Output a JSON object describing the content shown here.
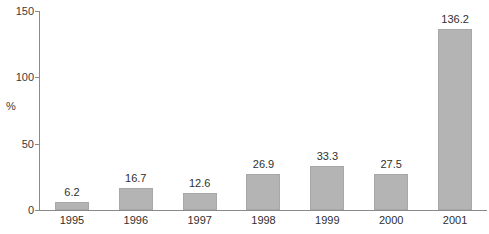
{
  "chart_data": {
    "type": "bar",
    "title": "",
    "subtitle": "",
    "xlabel": "",
    "ylabel": "%",
    "categories": [
      "1995",
      "1996",
      "1997",
      "1998",
      "1999",
      "2000",
      "2001"
    ],
    "values": [
      6.2,
      16.7,
      12.6,
      26.9,
      33.3,
      27.5,
      136.2
    ],
    "value_labels": [
      "6.2",
      "16.7",
      "12.6",
      "26.9",
      "33.3",
      "27.5",
      "136.2"
    ],
    "ylim": [
      0,
      150
    ],
    "y_ticks": [
      0,
      50,
      100,
      150
    ],
    "y_tick_labels": [
      "0",
      "50",
      "100",
      "150"
    ],
    "grid": false,
    "legend": null,
    "legend_position": "none",
    "bar_color": "#b4b4b4",
    "bar_border_color": "#a8a8a8",
    "axis_color": "#8a8a8a",
    "text_color": "#2f2f2f",
    "background_color": "#ffffff"
  }
}
